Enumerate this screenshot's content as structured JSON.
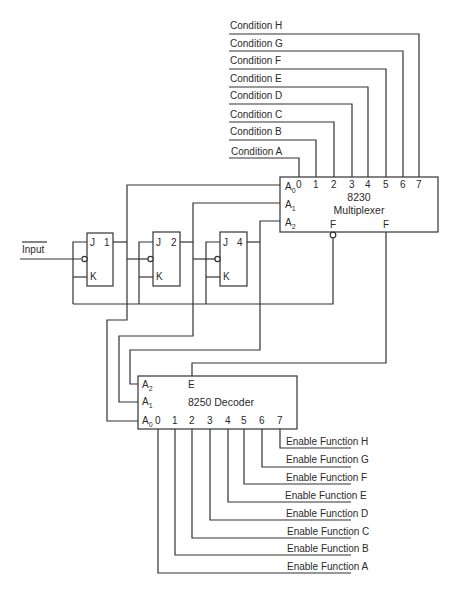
{
  "conditions": [
    {
      "label": "Condition H",
      "pin": "7"
    },
    {
      "label": "Condition G",
      "pin": "6"
    },
    {
      "label": "Condition F",
      "pin": "5"
    },
    {
      "label": "Condition E",
      "pin": "4"
    },
    {
      "label": "Condition D",
      "pin": "3"
    },
    {
      "label": "Condition C",
      "pin": "2"
    },
    {
      "label": "Condition B",
      "pin": "1"
    },
    {
      "label": "Condition A",
      "pin": "0"
    }
  ],
  "multiplexer": {
    "part": "8230",
    "name": "Multiplexer",
    "inputs": [
      "0",
      "1",
      "2",
      "3",
      "4",
      "5",
      "6",
      "7"
    ],
    "select": [
      {
        "base": "A",
        "sub": "0"
      },
      {
        "base": "A",
        "sub": "1"
      },
      {
        "base": "A",
        "sub": "2"
      }
    ],
    "out_inverted": "F",
    "out": "F"
  },
  "input": {
    "label": "Input"
  },
  "flipflops": [
    {
      "j": "J",
      "k": "K",
      "q": "1"
    },
    {
      "j": "J",
      "k": "K",
      "q": "2"
    },
    {
      "j": "J",
      "k": "K",
      "q": "4"
    }
  ],
  "decoder": {
    "title": "8250 Decoder",
    "enable": "E",
    "select": [
      {
        "base": "A",
        "sub": "2"
      },
      {
        "base": "A",
        "sub": "1"
      },
      {
        "base": "A",
        "sub": "0"
      }
    ],
    "outputs": [
      "0",
      "1",
      "2",
      "3",
      "4",
      "5",
      "6",
      "7"
    ]
  },
  "functions": [
    {
      "label": "Enable Function H"
    },
    {
      "label": "Enable Function G"
    },
    {
      "label": "Enable Function F"
    },
    {
      "label": "Enable Function E"
    },
    {
      "label": "Enable Function D"
    },
    {
      "label": "Enable Function C"
    },
    {
      "label": "Enable Function B"
    },
    {
      "label": "Enable Function A"
    }
  ]
}
